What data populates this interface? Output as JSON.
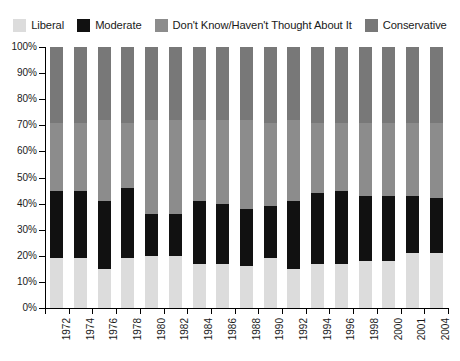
{
  "legend": {
    "position": "top",
    "items": [
      {
        "label": "Liberal",
        "color": "#dcdcdc"
      },
      {
        "label": "Moderate",
        "color": "#111111"
      },
      {
        "label": "Don't Know/Haven't Thought About It",
        "color": "#8c8c8c"
      },
      {
        "label": "Conservative",
        "color": "#787878"
      }
    ]
  },
  "yaxis": {
    "ticks": [
      "0%",
      "10%",
      "20%",
      "30%",
      "40%",
      "50%",
      "60%",
      "70%",
      "80%",
      "90%",
      "100%"
    ],
    "min": 0,
    "max": 100
  },
  "chart_data": {
    "type": "bar",
    "stacked": true,
    "title": "",
    "xlabel": "",
    "ylabel": "",
    "ylim": [
      0,
      100
    ],
    "grid": false,
    "legend_position": "top",
    "ytick_labels": [
      "0%",
      "10%",
      "20%",
      "30%",
      "40%",
      "50%",
      "60%",
      "70%",
      "80%",
      "90%",
      "100%"
    ],
    "categories": [
      "1972",
      "1974",
      "1976",
      "1978",
      "1980",
      "1982",
      "1984",
      "1986",
      "1988",
      "1990",
      "1992",
      "1994",
      "1996",
      "1998",
      "2000",
      "2001",
      "2004"
    ],
    "series": [
      {
        "name": "Liberal",
        "color": "#dcdcdc",
        "values": [
          19,
          19,
          15,
          19,
          20,
          20,
          17,
          17,
          16,
          19,
          15,
          17,
          17,
          18,
          18,
          21,
          21
        ]
      },
      {
        "name": "Moderate",
        "color": "#111111",
        "values": [
          26,
          26,
          26,
          27,
          16,
          16,
          24,
          23,
          22,
          20,
          26,
          27,
          28,
          25,
          25,
          22,
          21
        ]
      },
      {
        "name": "Don't Know/Haven't Thought About It",
        "color": "#8c8c8c",
        "values": [
          26,
          26,
          31,
          25,
          36,
          36,
          31,
          32,
          34,
          32,
          31,
          27,
          26,
          28,
          28,
          28,
          29
        ]
      },
      {
        "name": "Conservative",
        "color": "#787878",
        "values": [
          29,
          29,
          28,
          29,
          28,
          28,
          28,
          28,
          28,
          29,
          28,
          29,
          29,
          29,
          29,
          29,
          29
        ]
      }
    ]
  }
}
